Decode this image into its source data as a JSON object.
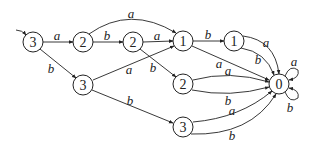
{
  "diagram": {
    "type": "automaton",
    "nodes": [
      {
        "id": "n3a",
        "label": "3",
        "x": 33,
        "y": 42
      },
      {
        "id": "n2a",
        "label": "2",
        "x": 83,
        "y": 42
      },
      {
        "id": "n2b",
        "label": "2",
        "x": 133,
        "y": 42
      },
      {
        "id": "n1a",
        "label": "1",
        "x": 183,
        "y": 41
      },
      {
        "id": "n1b",
        "label": "1",
        "x": 234,
        "y": 41
      },
      {
        "id": "n3b",
        "label": "3",
        "x": 83,
        "y": 85
      },
      {
        "id": "n2c",
        "label": "2",
        "x": 183,
        "y": 84
      },
      {
        "id": "n3c",
        "label": "3",
        "x": 183,
        "y": 127
      },
      {
        "id": "n0",
        "label": "0",
        "x": 279,
        "y": 84
      }
    ],
    "edges": [
      {
        "from": "start",
        "to": "n3a",
        "label": ""
      },
      {
        "from": "n3a",
        "to": "n2a",
        "label": "a"
      },
      {
        "from": "n3a",
        "to": "n3b",
        "label": "b"
      },
      {
        "from": "n2a",
        "to": "n2b",
        "label": "b"
      },
      {
        "from": "n2a",
        "to": "n1a",
        "label": "a"
      },
      {
        "from": "n2b",
        "to": "n1a",
        "label": "a"
      },
      {
        "from": "n2b",
        "to": "n2c",
        "label": "b"
      },
      {
        "from": "n3b",
        "to": "n1a",
        "label": "a"
      },
      {
        "from": "n3b",
        "to": "n3c",
        "label": "b"
      },
      {
        "from": "n1a",
        "to": "n1b",
        "label": "b"
      },
      {
        "from": "n1a",
        "to": "n0",
        "label": "a"
      },
      {
        "from": "n1b",
        "to": "n0",
        "label": "a"
      },
      {
        "from": "n1b",
        "to": "n0",
        "label": "b"
      },
      {
        "from": "n2c",
        "to": "n0",
        "label": "a"
      },
      {
        "from": "n2c",
        "to": "n0",
        "label": "b"
      },
      {
        "from": "n3c",
        "to": "n0",
        "label": "a"
      },
      {
        "from": "n3c",
        "to": "n0",
        "label": "b"
      },
      {
        "from": "n0",
        "to": "n0",
        "label": "a"
      },
      {
        "from": "n0",
        "to": "n0",
        "label": "b"
      }
    ]
  },
  "labels": {
    "n3a": "3",
    "n2a": "2",
    "n2b": "2",
    "n1a": "1",
    "n1b": "1",
    "n3b": "3",
    "n2c": "2",
    "n3c": "3",
    "n0": "0",
    "e_3a_2a": "a",
    "e_3a_3b": "b",
    "e_2a_2b": "b",
    "e_2a_1a": "a",
    "e_2b_1a": "a",
    "e_2b_2c": "b",
    "e_3b_1a": "a",
    "e_3b_3c": "b",
    "e_1a_1b": "b",
    "e_1a_0": "a",
    "e_1b_0a": "a",
    "e_1b_0b": "b",
    "e_2c_0a": "a",
    "e_2c_0b": "b",
    "e_3c_0a": "a",
    "e_3c_0b": "b",
    "loop_a": "a",
    "loop_b": "b"
  }
}
